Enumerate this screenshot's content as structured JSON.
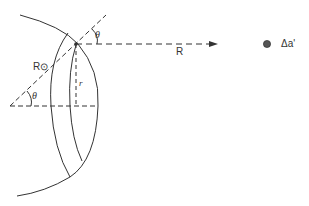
{
  "diagram": {
    "labels": {
      "theta_top": "θ",
      "theta_bottom": "θ",
      "r_sun": "R⊙",
      "r_small": "r",
      "R_distance": "R",
      "delta_a": "Δa'"
    },
    "colors": {
      "stroke": "#333333",
      "background": "#ffffff"
    }
  }
}
